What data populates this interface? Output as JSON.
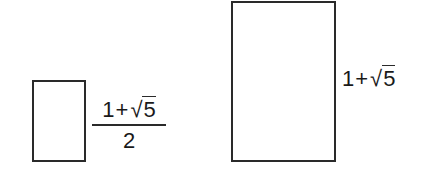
{
  "diagram": {
    "type": "golden-ratio-rectangles",
    "stroke_color": "#2a2a2a",
    "background": "#ffffff",
    "small_rectangle": {
      "label": {
        "numerator": {
          "one": "1",
          "plus": "+",
          "radical": "√",
          "radicand": "5"
        },
        "denominator": "2"
      }
    },
    "large_rectangle": {
      "label": {
        "one": "1",
        "plus": "+",
        "radical": "√",
        "radicand": "5"
      }
    }
  }
}
